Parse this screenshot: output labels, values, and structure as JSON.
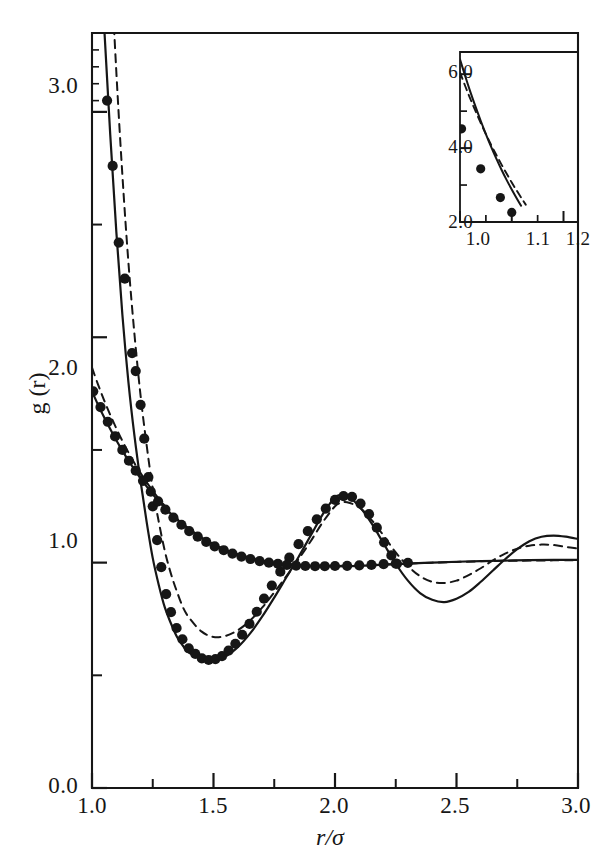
{
  "figure": {
    "caption_title": "",
    "background_color": "#ffffff",
    "ink_color": "#161616"
  },
  "main_axes": {
    "x_title": "r/σ",
    "y_title": "g (r)",
    "x_ticks_major": [
      "1.0",
      "1.5",
      "2.0",
      "2.5",
      "3.0"
    ],
    "y_ticks_major": [
      "0.0",
      "1.0",
      "2.0",
      "3.0"
    ]
  },
  "inset_axes": {
    "x_ticks_major": [
      "1.0",
      "1.1",
      "1.2"
    ],
    "y_ticks_major": [
      "2.0",
      "4.0",
      "6.0"
    ]
  },
  "chart_data": {
    "type": "line",
    "title": "",
    "subtitle": "",
    "xlabel": "r/σ",
    "ylabel": "g (r)",
    "xlim": [
      1.0,
      3.0
    ],
    "ylim": [
      0.0,
      3.35
    ],
    "grid": false,
    "legend": "none",
    "x_ticks_major": [
      1.0,
      1.5,
      2.0,
      2.5,
      3.0
    ],
    "x_ticks_minor": [
      1.25,
      1.75,
      2.25,
      2.75
    ],
    "y_ticks_major": [
      0.0,
      1.0,
      2.0,
      3.0
    ],
    "y_ticks_minor": [
      0.5,
      1.5,
      2.5
    ],
    "annotations": [],
    "series": [
      {
        "name": "dense-fluid-solid-curve",
        "style": "solid",
        "x": [
          1.0,
          1.025,
          1.05,
          1.075,
          1.1,
          1.125,
          1.15,
          1.175,
          1.2,
          1.225,
          1.25,
          1.275,
          1.3,
          1.325,
          1.35,
          1.375,
          1.4,
          1.45,
          1.5,
          1.55,
          1.6,
          1.65,
          1.7,
          1.75,
          1.8,
          1.85,
          1.9,
          1.95,
          2.0,
          2.025,
          2.05,
          2.1,
          2.15,
          2.2,
          2.25,
          2.3,
          2.35,
          2.4,
          2.45,
          2.5,
          2.55,
          2.6,
          2.65,
          2.7,
          2.75,
          2.8,
          2.85,
          2.9,
          2.95,
          3.0
        ],
        "y": [
          4.5,
          3.92,
          3.38,
          2.9,
          2.47,
          2.1,
          1.8,
          1.56,
          1.36,
          1.18,
          1.02,
          0.9,
          0.8,
          0.73,
          0.67,
          0.63,
          0.6,
          0.575,
          0.57,
          0.585,
          0.625,
          0.685,
          0.76,
          0.845,
          0.935,
          1.025,
          1.12,
          1.215,
          1.29,
          1.3,
          1.295,
          1.25,
          1.175,
          1.085,
          0.995,
          0.92,
          0.865,
          0.835,
          0.825,
          0.84,
          0.87,
          0.915,
          0.965,
          1.015,
          1.06,
          1.095,
          1.115,
          1.12,
          1.115,
          1.105
        ]
      },
      {
        "name": "dense-fluid-dashed-curve",
        "style": "dashed",
        "x": [
          1.0,
          1.025,
          1.05,
          1.075,
          1.1,
          1.125,
          1.15,
          1.175,
          1.2,
          1.225,
          1.25,
          1.275,
          1.3,
          1.325,
          1.35,
          1.375,
          1.4,
          1.45,
          1.5,
          1.55,
          1.6,
          1.65,
          1.7,
          1.75,
          1.8,
          1.85,
          1.9,
          1.95,
          2.0,
          2.025,
          2.05,
          2.1,
          2.15,
          2.2,
          2.25,
          2.3,
          2.35,
          2.4,
          2.45,
          2.5,
          2.55,
          2.6,
          2.65,
          2.7,
          2.75,
          2.8,
          2.85,
          2.9,
          2.95,
          3.0
        ],
        "y": [
          6.05,
          5.1,
          4.35,
          3.72,
          3.18,
          2.72,
          2.33,
          2.01,
          1.74,
          1.52,
          1.33,
          1.18,
          1.05,
          0.95,
          0.87,
          0.8,
          0.755,
          0.695,
          0.67,
          0.675,
          0.7,
          0.742,
          0.8,
          0.868,
          0.94,
          1.015,
          1.095,
          1.18,
          1.25,
          1.265,
          1.268,
          1.245,
          1.19,
          1.12,
          1.045,
          0.985,
          0.94,
          0.915,
          0.91,
          0.92,
          0.945,
          0.975,
          1.01,
          1.04,
          1.062,
          1.075,
          1.08,
          1.078,
          1.07,
          1.062
        ]
      },
      {
        "name": "dilute-fluid-solid-curve",
        "style": "solid",
        "x": [
          1.0,
          1.025,
          1.05,
          1.075,
          1.1,
          1.125,
          1.15,
          1.175,
          1.2,
          1.25,
          1.3,
          1.35,
          1.4,
          1.45,
          1.5,
          1.55,
          1.6,
          1.65,
          1.7,
          1.75,
          1.8,
          1.85,
          1.9,
          1.95,
          2.0,
          2.1,
          2.2,
          2.3,
          2.4,
          2.5,
          2.6,
          2.7,
          2.8,
          2.9,
          3.0
        ],
        "y": [
          1.76,
          1.7,
          1.645,
          1.593,
          1.543,
          1.497,
          1.453,
          1.412,
          1.374,
          1.303,
          1.243,
          1.192,
          1.148,
          1.112,
          1.082,
          1.057,
          1.037,
          1.021,
          1.008,
          0.999,
          0.992,
          0.987,
          0.984,
          0.983,
          0.983,
          0.986,
          0.991,
          0.996,
          1.0,
          1.004,
          1.007,
          1.009,
          1.011,
          1.012,
          1.012
        ]
      },
      {
        "name": "dilute-fluid-dashed-curve",
        "style": "dashed",
        "x": [
          1.0,
          1.025,
          1.05,
          1.075,
          1.1,
          1.125,
          1.15,
          1.175,
          1.2,
          1.25,
          1.3,
          1.35,
          1.4,
          1.45,
          1.5,
          1.55,
          1.6,
          1.65,
          1.7,
          1.75,
          1.8,
          1.85,
          1.9,
          1.95,
          2.0,
          2.1,
          2.2,
          2.3,
          2.4,
          2.5,
          2.6,
          2.7,
          2.8,
          2.9,
          3.0
        ],
        "y": [
          1.865,
          1.79,
          1.72,
          1.656,
          1.596,
          1.54,
          1.489,
          1.441,
          1.397,
          1.318,
          1.252,
          1.196,
          1.15,
          1.112,
          1.081,
          1.056,
          1.036,
          1.021,
          1.009,
          1.0,
          0.994,
          0.99,
          0.987,
          0.986,
          0.986,
          0.988,
          0.992,
          0.996,
          1.0,
          1.003,
          1.006,
          1.008,
          1.009,
          1.01,
          1.01
        ]
      }
    ],
    "scatter": [
      {
        "name": "dense-fluid-simulation-points",
        "marker": "filled-circle",
        "points": [
          [
            1.02,
            3.95
          ],
          [
            1.04,
            3.42
          ],
          [
            1.062,
            3.05
          ],
          [
            1.085,
            2.76
          ],
          [
            1.11,
            2.42
          ],
          [
            1.135,
            2.26
          ],
          [
            1.165,
            1.93
          ],
          [
            1.18,
            1.85
          ],
          [
            1.2,
            1.7
          ],
          [
            1.215,
            1.55
          ],
          [
            1.232,
            1.38
          ],
          [
            1.25,
            1.25
          ],
          [
            1.268,
            1.1
          ],
          [
            1.285,
            0.98
          ],
          [
            1.305,
            0.86
          ],
          [
            1.325,
            0.78
          ],
          [
            1.348,
            0.71
          ],
          [
            1.372,
            0.66
          ],
          [
            1.398,
            0.62
          ],
          [
            1.425,
            0.595
          ],
          [
            1.452,
            0.575
          ],
          [
            1.48,
            0.568
          ],
          [
            1.508,
            0.572
          ],
          [
            1.535,
            0.585
          ],
          [
            1.562,
            0.61
          ],
          [
            1.59,
            0.64
          ],
          [
            1.618,
            0.68
          ],
          [
            1.648,
            0.728
          ],
          [
            1.678,
            0.782
          ],
          [
            1.708,
            0.84
          ],
          [
            1.74,
            0.898
          ],
          [
            1.775,
            0.96
          ],
          [
            1.812,
            1.022
          ],
          [
            1.85,
            1.082
          ],
          [
            1.888,
            1.14
          ],
          [
            1.925,
            1.192
          ],
          [
            1.962,
            1.24
          ],
          [
            2.0,
            1.278
          ],
          [
            2.035,
            1.295
          ],
          [
            2.07,
            1.292
          ],
          [
            2.105,
            1.262
          ],
          [
            2.14,
            1.215
          ],
          [
            2.172,
            1.155
          ],
          [
            2.202,
            1.09
          ],
          [
            2.232,
            1.032
          ],
          [
            2.255,
            0.995
          ]
        ]
      },
      {
        "name": "dilute-fluid-simulation-points",
        "marker": "filled-circle",
        "points": [
          [
            1.005,
            1.76
          ],
          [
            1.035,
            1.69
          ],
          [
            1.065,
            1.625
          ],
          [
            1.095,
            1.56
          ],
          [
            1.125,
            1.5
          ],
          [
            1.152,
            1.452
          ],
          [
            1.18,
            1.408
          ],
          [
            1.21,
            1.363
          ],
          [
            1.242,
            1.315
          ],
          [
            1.272,
            1.272
          ],
          [
            1.302,
            1.235
          ],
          [
            1.335,
            1.2
          ],
          [
            1.368,
            1.168
          ],
          [
            1.4,
            1.14
          ],
          [
            1.435,
            1.115
          ],
          [
            1.47,
            1.092
          ],
          [
            1.505,
            1.072
          ],
          [
            1.542,
            1.055
          ],
          [
            1.578,
            1.04
          ],
          [
            1.615,
            1.027
          ],
          [
            1.652,
            1.016
          ],
          [
            1.69,
            1.007
          ],
          [
            1.728,
            1.0
          ],
          [
            1.765,
            0.995
          ],
          [
            1.802,
            0.99
          ],
          [
            1.84,
            0.987
          ],
          [
            1.878,
            0.985
          ],
          [
            1.918,
            0.984
          ],
          [
            1.958,
            0.984
          ],
          [
            2.0,
            0.985
          ],
          [
            2.05,
            0.986
          ],
          [
            2.1,
            0.988
          ],
          [
            2.15,
            0.99
          ],
          [
            2.2,
            0.993
          ],
          [
            2.25,
            0.996
          ],
          [
            2.3,
            0.999
          ]
        ]
      }
    ],
    "inset": {
      "type": "line",
      "xlim": [
        1.0,
        1.228
      ],
      "ylim": [
        2.0,
        6.6
      ],
      "xlabel": "",
      "ylabel": "",
      "grid": false,
      "x_ticks_major": [
        1.0,
        1.1,
        1.2
      ],
      "x_ticks_minor": [
        1.05,
        1.15
      ],
      "y_ticks_major": [
        2.0,
        4.0,
        6.0
      ],
      "y_ticks_minor": [
        3.0,
        5.0
      ],
      "series": [
        {
          "name": "inset-solid-curve",
          "style": "solid",
          "x": [
            1.0,
            1.01,
            1.02,
            1.03,
            1.04,
            1.05,
            1.06,
            1.07,
            1.08,
            1.09,
            1.1,
            1.11,
            1.118
          ],
          "y": [
            6.4,
            5.95,
            5.52,
            5.12,
            4.74,
            4.38,
            4.04,
            3.72,
            3.42,
            3.14,
            2.88,
            2.63,
            2.44
          ]
        },
        {
          "name": "inset-dashed-curve",
          "style": "dashed",
          "x": [
            1.0,
            1.01,
            1.02,
            1.03,
            1.04,
            1.05,
            1.06,
            1.07,
            1.08,
            1.09,
            1.1,
            1.11,
            1.12,
            1.127
          ],
          "y": [
            6.05,
            5.68,
            5.33,
            5.0,
            4.68,
            4.38,
            4.09,
            3.82,
            3.56,
            3.31,
            3.07,
            2.84,
            2.62,
            2.47
          ]
        }
      ],
      "scatter": [
        {
          "name": "inset-simulation-points",
          "marker": "filled-circle",
          "points": [
            [
              1.003,
              4.52
            ],
            [
              1.04,
              3.44
            ],
            [
              1.078,
              2.66
            ],
            [
              1.1,
              2.26
            ]
          ]
        }
      ]
    }
  }
}
